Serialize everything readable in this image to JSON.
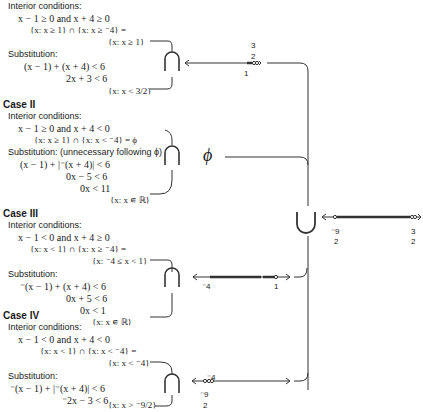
{
  "case1": {
    "interior_label": "Interior conditions:",
    "condition": "x − 1 ≥ 0 and x + 4 ≥ 0",
    "intersection": "{x: x ≥ 1} ∩ {x: x ≥ ⁻4} =",
    "result": "{x: x ≥ 1}",
    "substitution_label": "Substitution:",
    "sub_line1": "(x − 1) + (x + 4) < 6",
    "sub_line2": "2x + 3 < 6",
    "sub_result": "{x: x < 3/2}",
    "numberline": {
      "left_label": "1",
      "right_label_num": "3",
      "right_label_den": "2"
    }
  },
  "case2": {
    "title": "Case II",
    "interior_label": "Interior conditions:",
    "condition": "x − 1 ≥ 0 and x + 4 < 0",
    "intersection": "{x: x ≥ 1} ∩ {x: x < ⁻4} = ϕ",
    "substitution_label": "Substitution: (unnecessary following ϕ)",
    "sub_line1": "(x − 1) + |⁻(x + 4)| < 6",
    "sub_line2": "0x − 5 < 6",
    "sub_line3": "0x < 11",
    "sub_result": "{x: x ∊ ℝ}",
    "result_symbol": "ϕ"
  },
  "case3": {
    "title": "Case III",
    "interior_label": "Interior conditions:",
    "condition": "x − 1 < 0 and x + 4 ≥ 0",
    "intersection": "{x: x < 1} ∩ {x: x ≥ ⁻4} =",
    "result": "{x: ⁻4 ≤ x < 1}",
    "substitution_label": "Substitution:",
    "sub_line1": "⁻(x − 1) + (x + 4) < 6",
    "sub_line2": "0x + 5 < 6",
    "sub_line3": "0x < 1",
    "sub_result": "{x: x ∊ ℝ}",
    "numberline": {
      "left_label": "⁻4",
      "right_label": "1"
    }
  },
  "case4": {
    "title": "Case IV",
    "interior_label": "Interior conditions:",
    "condition": "x − 1 < 0 and x + 4 < 0",
    "intersection": "{x: x < 1} ∩ {x: x < ⁻4} =",
    "result": "{x: x < ⁻4}",
    "substitution_label": "Substitution:",
    "sub_line1": "⁻(x − 1) + |⁻(x + 4)| < 6",
    "sub_line2": "⁻2x − 3 < 6",
    "sub_result": "{x: x > ⁻9/2}",
    "numberline": {
      "top_label": "⁻4",
      "bottom_label_num": "⁻9",
      "bottom_label_den": "2"
    }
  },
  "union": {
    "symbol": "∪",
    "numberline": {
      "left_label_num": "⁻9",
      "left_label_den": "2",
      "right_label_num": "3",
      "right_label_den": "2"
    }
  }
}
